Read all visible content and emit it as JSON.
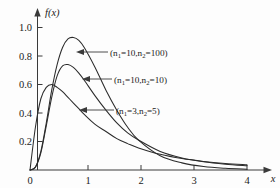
{
  "figure": {
    "background_color": "#fdfdfd",
    "curve_color": "#2b2b2b",
    "axis_color": "#3a3a3a"
  },
  "axes": {
    "x_name": "x",
    "y_name": "f(x)",
    "x_ticks": [
      "0",
      "1",
      "2",
      "3",
      "4"
    ],
    "y_ticks": [
      "0.2",
      "0.4",
      "0.6",
      "0.8",
      "1.0"
    ],
    "origin_label": "0"
  },
  "annotations": [
    {
      "prefix": "(n",
      "sub1": "1",
      "mid": "=10,n",
      "sub2": "2",
      "suffix": "=100)"
    },
    {
      "prefix": "(n",
      "sub1": "1",
      "mid": "=10,n",
      "sub2": "2",
      "suffix": "=10)"
    },
    {
      "prefix": "(n",
      "sub1": "1",
      "mid": "=3,n",
      "sub2": "2",
      "suffix": "=5)"
    }
  ],
  "chart_data": {
    "type": "line",
    "title": "",
    "xlabel": "x",
    "ylabel": "f(x)",
    "xlim": [
      0,
      4.2
    ],
    "ylim": [
      0,
      1.05
    ],
    "xticks": [
      0,
      1,
      2,
      3,
      4
    ],
    "yticks": [
      0.2,
      0.4,
      0.6,
      0.8,
      1.0
    ],
    "grid": false,
    "legend": "inline-annotations",
    "series": [
      {
        "name": "(n1=10,n2=100)",
        "peak_x": 0.82,
        "peak_y": 0.93,
        "x": [
          0.0,
          0.1,
          0.2,
          0.3,
          0.4,
          0.5,
          0.6,
          0.7,
          0.8,
          0.9,
          1.0,
          1.2,
          1.4,
          1.6,
          1.8,
          2.0,
          2.4,
          2.8,
          3.2,
          3.6,
          4.0
        ],
        "values": [
          0.0,
          0.02,
          0.13,
          0.33,
          0.56,
          0.74,
          0.86,
          0.92,
          0.93,
          0.91,
          0.86,
          0.72,
          0.56,
          0.42,
          0.3,
          0.21,
          0.1,
          0.05,
          0.024,
          0.012,
          0.006
        ]
      },
      {
        "name": "(n1=10,n2=10)",
        "peak_x": 0.7,
        "peak_y": 0.74,
        "x": [
          0.0,
          0.1,
          0.2,
          0.3,
          0.4,
          0.5,
          0.6,
          0.7,
          0.8,
          0.9,
          1.0,
          1.2,
          1.4,
          1.6,
          1.8,
          2.0,
          2.4,
          2.8,
          3.2,
          3.6,
          4.0
        ],
        "values": [
          0.0,
          0.02,
          0.12,
          0.31,
          0.51,
          0.66,
          0.73,
          0.74,
          0.72,
          0.68,
          0.63,
          0.52,
          0.42,
          0.33,
          0.26,
          0.21,
          0.13,
          0.085,
          0.058,
          0.041,
          0.03
        ]
      },
      {
        "name": "(n1=3,n2=5)",
        "peak_x": 0.4,
        "peak_y": 0.6,
        "x": [
          0.0,
          0.1,
          0.2,
          0.3,
          0.4,
          0.5,
          0.6,
          0.7,
          0.8,
          0.9,
          1.0,
          1.2,
          1.4,
          1.6,
          1.8,
          2.0,
          2.4,
          2.8,
          3.2,
          3.6,
          4.0
        ],
        "values": [
          0.0,
          0.3,
          0.5,
          0.58,
          0.6,
          0.58,
          0.55,
          0.51,
          0.47,
          0.43,
          0.39,
          0.32,
          0.27,
          0.22,
          0.185,
          0.155,
          0.11,
          0.08,
          0.06,
          0.046,
          0.036
        ]
      }
    ]
  }
}
